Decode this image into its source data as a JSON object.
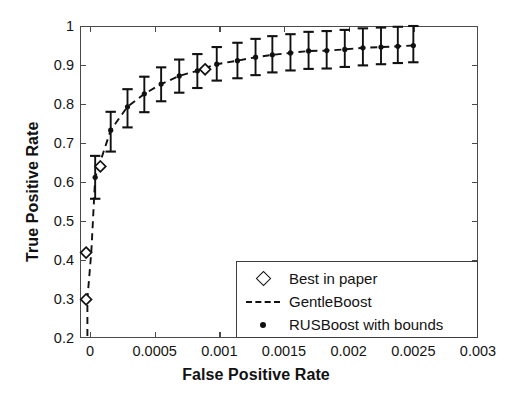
{
  "chart_data": {
    "type": "line",
    "title": "",
    "xlabel": "False Positive Rate",
    "ylabel": "True Positive Rate",
    "xlim": [
      0,
      0.003
    ],
    "ylim": [
      0.2,
      1
    ],
    "grid": false,
    "legend_position": "lower right",
    "xticks": [
      0,
      0.0005,
      0.001,
      0.0015,
      0.002,
      0.0025,
      0.003
    ],
    "xticklabels": [
      "0",
      "0.0005",
      "0.001",
      "0.0015",
      "0.002",
      "0.0025",
      "0.003"
    ],
    "yticks": [
      0.2,
      0.3,
      0.4,
      0.5,
      0.6,
      0.7,
      0.8,
      0.9,
      1
    ],
    "yticklabels": [
      "0.2",
      "0.3",
      "0.4",
      "0.5",
      "0.6",
      "0.7",
      "0.8",
      "0.9",
      "1"
    ],
    "series": [
      {
        "name": "RUSBoost with bounds",
        "marker": "dot",
        "style": "errorbar",
        "x": [
          4e-05,
          0.00016,
          0.00029,
          0.00042,
          0.00055,
          0.00069,
          0.00083,
          0.00098,
          0.00114,
          0.00128,
          0.00141,
          0.00155,
          0.00169,
          0.00183,
          0.00197,
          0.00211,
          0.00225,
          0.00238,
          0.0025
        ],
        "y": [
          0.612,
          0.733,
          0.793,
          0.826,
          0.851,
          0.872,
          0.885,
          0.902,
          0.911,
          0.92,
          0.926,
          0.931,
          0.936,
          0.937,
          0.94,
          0.944,
          0.946,
          0.948,
          0.95
        ],
        "yerr_low": [
          0.055,
          0.055,
          0.053,
          0.047,
          0.044,
          0.043,
          0.044,
          0.042,
          0.045,
          0.046,
          0.045,
          0.045,
          0.046,
          0.046,
          0.045,
          0.045,
          0.044,
          0.043,
          0.043
        ],
        "yerr_high": [
          0.055,
          0.047,
          0.045,
          0.044,
          0.043,
          0.042,
          0.043,
          0.044,
          0.046,
          0.047,
          0.048,
          0.048,
          0.049,
          0.05,
          0.05,
          0.05,
          0.05,
          0.05,
          0.05
        ]
      },
      {
        "name": "GentleBoost",
        "marker": "none",
        "style": "dashed",
        "x": [
          -2e-05,
          -2e-05,
          1e-05,
          4e-05,
          0.00016,
          0.00029,
          0.00042,
          0.00055,
          0.00069,
          0.00083,
          0.00098,
          0.00114,
          0.00128,
          0.00141,
          0.00155,
          0.00169,
          0.00183,
          0.00197,
          0.00211,
          0.00225,
          0.00238,
          0.0025
        ],
        "y": [
          0.205,
          0.3,
          0.42,
          0.612,
          0.733,
          0.793,
          0.826,
          0.851,
          0.872,
          0.885,
          0.902,
          0.911,
          0.92,
          0.926,
          0.931,
          0.936,
          0.937,
          0.94,
          0.944,
          0.946,
          0.948,
          0.95
        ]
      },
      {
        "name": "Best in paper",
        "marker": "diamond",
        "style": "points",
        "x": [
          -3e-05,
          -3e-05,
          8e-05,
          0.00089
        ],
        "y": [
          0.299,
          0.419,
          0.64,
          0.889
        ]
      }
    ]
  },
  "axis": {
    "x_title": "False Positive Rate",
    "y_title": "True Positive Rate"
  },
  "legend": {
    "entries": [
      {
        "key": "diamond-marker",
        "label": "Best in paper"
      },
      {
        "key": "dashed-line",
        "label": "GentleBoost"
      },
      {
        "key": "dot-marker",
        "label": "RUSBoost with bounds"
      }
    ]
  },
  "colors": {
    "line": "#111111",
    "frame": "#4a4a4a",
    "text": "#121212",
    "background": "#ffffff"
  }
}
